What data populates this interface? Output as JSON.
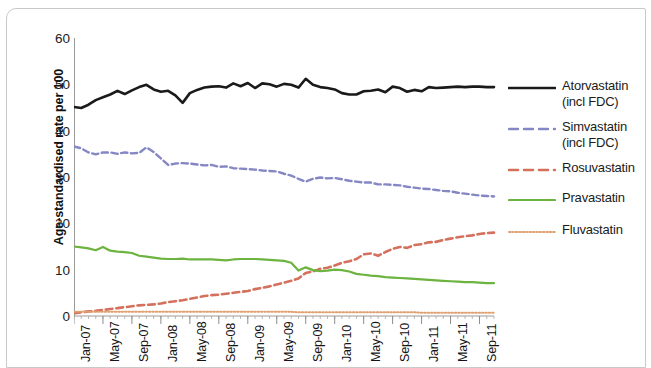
{
  "chart_data": {
    "type": "line",
    "title": "",
    "xlabel": "",
    "ylabel": "Age-standardised rate per 100",
    "ylim": [
      0,
      60
    ],
    "yticks": [
      0,
      10,
      20,
      30,
      40,
      50,
      60
    ],
    "grid": false,
    "legend_position": "right",
    "x": [
      "Jan-07",
      "Feb-07",
      "Mar-07",
      "Apr-07",
      "May-07",
      "Jun-07",
      "Jul-07",
      "Aug-07",
      "Sep-07",
      "Oct-07",
      "Nov-07",
      "Dec-07",
      "Jan-08",
      "Feb-08",
      "Mar-08",
      "Apr-08",
      "May-08",
      "Jun-08",
      "Jul-08",
      "Aug-08",
      "Sep-08",
      "Oct-08",
      "Nov-08",
      "Dec-08",
      "Jan-09",
      "Feb-09",
      "Mar-09",
      "Apr-09",
      "May-09",
      "Jun-09",
      "Jul-09",
      "Aug-09",
      "Sep-09",
      "Oct-09",
      "Nov-09",
      "Dec-09",
      "Jan-10",
      "Feb-10",
      "Mar-10",
      "Apr-10",
      "May-10",
      "Jun-10",
      "Jul-10",
      "Aug-10",
      "Sep-10",
      "Oct-10",
      "Nov-10",
      "Dec-10",
      "Jan-11",
      "Feb-11",
      "Mar-11",
      "Apr-11",
      "May-11",
      "Jun-11",
      "Jul-11",
      "Aug-11",
      "Sep-11",
      "Oct-11",
      "Nov-11"
    ],
    "xticklabels": [
      "Jan-07",
      "May-07",
      "Sep-07",
      "Jan-08",
      "May-08",
      "Sep-08",
      "Jan-09",
      "May-09",
      "Sep-09",
      "Jan-10",
      "May-10",
      "Sep-10",
      "Jan-11",
      "May-11",
      "Sep-11"
    ],
    "xtick_indices": [
      0,
      4,
      8,
      12,
      16,
      20,
      24,
      28,
      32,
      36,
      40,
      44,
      48,
      52,
      56
    ],
    "series": [
      {
        "name": "Atorvastatin (incl FDC)",
        "legend_line1": "Atorvastatin",
        "legend_line2": "(incl FDC)",
        "color": "#1a1a1a",
        "style": "solid",
        "width": 2.6,
        "values": [
          45.1,
          44.9,
          45.6,
          46.6,
          47.2,
          47.8,
          48.6,
          47.9,
          48.7,
          49.4,
          49.9,
          48.9,
          48.4,
          48.6,
          47.6,
          46.0,
          48.1,
          48.8,
          49.3,
          49.5,
          49.6,
          49.3,
          50.2,
          49.6,
          50.3,
          49.2,
          50.2,
          50.0,
          49.5,
          50.1,
          49.9,
          49.3,
          51.2,
          49.9,
          49.4,
          49.2,
          48.9,
          48.1,
          47.8,
          47.8,
          48.5,
          48.6,
          48.9,
          48.3,
          49.5,
          49.2,
          48.4,
          48.8,
          48.5,
          49.4,
          49.2,
          49.3,
          49.4,
          49.5,
          49.4,
          49.5,
          49.5,
          49.4,
          49.4
        ]
      },
      {
        "name": "Simvastatin (incl FDC)",
        "legend_line1": "Simvastatin",
        "legend_line2": "(incl FDC)",
        "color": "#8487c4",
        "style": "dashed",
        "width": 2.4,
        "values": [
          36.6,
          36.2,
          35.3,
          34.9,
          35.3,
          35.3,
          35.0,
          35.3,
          35.1,
          35.2,
          36.4,
          35.4,
          34.0,
          32.6,
          32.9,
          33.0,
          32.9,
          32.7,
          32.5,
          32.6,
          32.2,
          32.3,
          31.9,
          31.8,
          31.7,
          31.6,
          31.4,
          31.3,
          31.2,
          30.7,
          30.3,
          29.6,
          29.0,
          29.6,
          29.9,
          29.7,
          29.8,
          29.5,
          29.2,
          29.0,
          28.8,
          28.8,
          28.4,
          28.4,
          28.3,
          28.2,
          27.9,
          27.7,
          27.5,
          27.4,
          27.2,
          27.0,
          26.9,
          26.6,
          26.4,
          26.2,
          26.0,
          25.9,
          25.8
        ]
      },
      {
        "name": "Rosuvastatin",
        "legend_line1": "Rosuvastatin",
        "legend_line2": "",
        "color": "#d4705c",
        "style": "dashed",
        "width": 2.6,
        "values": [
          0.6,
          0.8,
          1.0,
          1.1,
          1.3,
          1.5,
          1.7,
          1.9,
          2.1,
          2.3,
          2.4,
          2.5,
          2.7,
          3.0,
          3.2,
          3.4,
          3.7,
          4.0,
          4.3,
          4.5,
          4.6,
          4.8,
          5.0,
          5.2,
          5.4,
          5.8,
          6.1,
          6.4,
          6.8,
          7.2,
          7.6,
          8.1,
          9.3,
          9.6,
          10.2,
          10.4,
          10.9,
          11.5,
          11.8,
          12.3,
          13.3,
          13.5,
          13.0,
          13.8,
          14.5,
          14.9,
          14.7,
          15.3,
          15.5,
          15.9,
          16.0,
          16.4,
          16.7,
          17.0,
          17.2,
          17.4,
          17.7,
          17.9,
          18.0
        ]
      },
      {
        "name": "Pravastatin",
        "legend_line1": "Pravastatin",
        "legend_line2": "",
        "color": "#6cb33f",
        "style": "solid",
        "width": 2.2,
        "values": [
          15.0,
          14.8,
          14.6,
          14.2,
          14.9,
          14.1,
          13.9,
          13.8,
          13.6,
          13.0,
          12.8,
          12.6,
          12.4,
          12.3,
          12.3,
          12.4,
          12.2,
          12.2,
          12.2,
          12.2,
          12.1,
          12.0,
          12.2,
          12.3,
          12.3,
          12.3,
          12.2,
          12.1,
          12.0,
          11.9,
          11.5,
          9.8,
          10.5,
          9.9,
          9.7,
          9.8,
          10.0,
          9.9,
          9.6,
          9.1,
          8.9,
          8.7,
          8.6,
          8.4,
          8.3,
          8.2,
          8.1,
          8.0,
          7.9,
          7.8,
          7.7,
          7.6,
          7.5,
          7.4,
          7.3,
          7.3,
          7.2,
          7.1,
          7.1
        ]
      },
      {
        "name": "Fluvastatin",
        "legend_line1": "Fluvastatin",
        "legend_line2": "",
        "color": "#e0a070",
        "style": "dotted",
        "width": 2.0,
        "values": [
          0.9,
          0.9,
          0.9,
          0.9,
          0.9,
          0.9,
          0.9,
          0.9,
          0.9,
          0.9,
          0.9,
          0.9,
          0.9,
          0.9,
          0.9,
          0.9,
          0.9,
          0.9,
          0.9,
          0.9,
          0.9,
          0.9,
          0.9,
          0.9,
          0.9,
          0.9,
          0.9,
          0.9,
          0.9,
          0.9,
          0.9,
          0.8,
          0.8,
          0.8,
          0.8,
          0.8,
          0.8,
          0.8,
          0.8,
          0.8,
          0.8,
          0.8,
          0.8,
          0.8,
          0.8,
          0.8,
          0.8,
          0.8,
          0.7,
          0.7,
          0.7,
          0.7,
          0.7,
          0.7,
          0.7,
          0.7,
          0.7,
          0.7,
          0.7
        ]
      }
    ]
  }
}
